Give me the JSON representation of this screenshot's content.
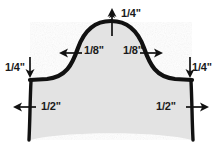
{
  "figure": {
    "fill_color": "#e3e3e3",
    "outline_color": "#111111",
    "background_color": "#ffffff",
    "text_color": "#1a1a1a"
  },
  "dimensions": {
    "top_height": {
      "label": "1/4\"",
      "icon": "arrow-up-icon",
      "position": "top-center"
    },
    "mid_left_inset": {
      "label": "1/8\"",
      "icon": "arrow-left-icon",
      "position": "middle-left-of-arch"
    },
    "mid_right_inset": {
      "label": "1/8\"",
      "icon": "arrow-right-icon",
      "position": "middle-right-of-arch"
    },
    "left_drop": {
      "label": "1/4\"",
      "icon": "arrow-down-icon",
      "position": "left-shoulder"
    },
    "right_drop": {
      "label": "1/4\"",
      "icon": "arrow-down-icon",
      "position": "right-shoulder"
    },
    "bottom_left_offset": {
      "label": "1/2\"",
      "icon": "arrow-left-icon",
      "position": "bottom-left-edge"
    },
    "bottom_right_offset": {
      "label": "1/2\"",
      "icon": "arrow-right-icon",
      "position": "bottom-right-edge"
    }
  }
}
